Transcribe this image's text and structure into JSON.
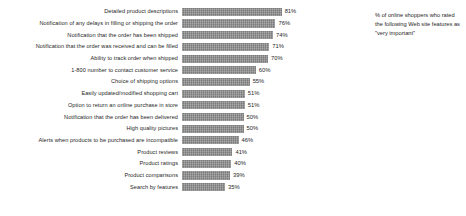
{
  "annotation": {
    "text": "% of online shoppers who rated the following Web site features as \"very important\""
  },
  "chart_data": {
    "type": "bar",
    "title": "",
    "subtitle": "",
    "xlabel": "",
    "ylabel": "",
    "orientation": "horizontal",
    "grid": false,
    "legend": false,
    "xlim": [
      0,
      100
    ],
    "value_suffix": "%",
    "bar_color": "#8a8a8a",
    "categories": [
      "Detailed product descriptions",
      "Notification of any delays in filling or shipping the order",
      "Notification that the order has been shipped",
      "Notification that the order was received and can be filled",
      "Ability to track order when shipped",
      "1-800 number to contact customer service",
      "Choice of shipping options",
      "Easily updated/modified shopping cart",
      "Option to return an online purchase in store",
      "Notification that the order has been delivered",
      "High quality pictures",
      "Alerts when products to be purchased are incompatible",
      "Product reviews",
      "Product ratings",
      "Product comparisons",
      "Search by features"
    ],
    "values": [
      81,
      76,
      74,
      71,
      70,
      60,
      55,
      51,
      51,
      50,
      50,
      46,
      41,
      40,
      39,
      35
    ],
    "value_labels": [
      "81%",
      "76%",
      "74%",
      "71%",
      "70%",
      "60%",
      "55%",
      "51%",
      "51%",
      "50%",
      "50%",
      "46%",
      "41%",
      "40%",
      "39%",
      "35%"
    ]
  }
}
